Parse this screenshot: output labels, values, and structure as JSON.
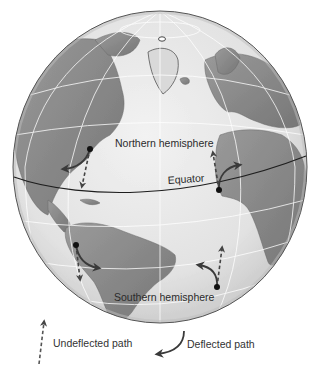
{
  "figure": {
    "labels": {
      "northern_hemisphere": "Northern hemisphere",
      "southern_hemisphere": "Southern hemisphere",
      "equator": "Equator"
    },
    "legend": {
      "undeflected": "Undeflected path",
      "deflected": "Deflected path"
    },
    "paths": [
      {
        "id": "north-america",
        "hemisphere": "northern",
        "undeflected_direction": "south",
        "deflection": "right"
      },
      {
        "id": "west-africa",
        "hemisphere": "northern",
        "undeflected_direction": "north",
        "deflection": "right"
      },
      {
        "id": "south-america",
        "hemisphere": "southern",
        "undeflected_direction": "south",
        "deflection": "left"
      },
      {
        "id": "south-atlantic",
        "hemisphere": "southern",
        "undeflected_direction": "north",
        "deflection": "left"
      }
    ],
    "colors": {
      "ocean": "#e6e6e6",
      "land": "#8f8f8f",
      "grid": "#ffffff",
      "arrow": "#3a3a3a",
      "equator_line": "#1e1e1e"
    }
  }
}
